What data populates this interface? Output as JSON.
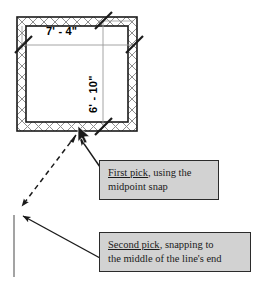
{
  "drawing": {
    "type": "cad-floor-plan-annotation",
    "title": "Midpoint snap line draw illustration",
    "background_color": "#ffffff",
    "line_color": "#1a1a1a",
    "wall_hatch_color": "#8a8a8a",
    "dim_line_color": "#9a9a9a",
    "existing_line_color": "#8c8c8c",
    "callout_fill": "#d2d2d2",
    "callout_border": "#2b2b2b"
  },
  "plan": {
    "name": "rectangular-room",
    "outer": {
      "x": 17,
      "y": 17,
      "w": 120,
      "h": 114
    },
    "inner": {
      "x": 27,
      "y": 26,
      "w": 101,
      "h": 95
    },
    "wall_thickness": 9
  },
  "dimensions": [
    {
      "id": "horizontal",
      "value": "7' - 4\"",
      "orientation": "horizontal",
      "text_x": 46,
      "text_y": 32
    },
    {
      "id": "vertical",
      "value": "6' - 10\"",
      "orientation": "vertical",
      "text_x": 87,
      "text_y": 113
    }
  ],
  "new_line": {
    "name": "dashed-rubber-band-line",
    "style": "dashed",
    "from_label": "midpoint of bottom wall",
    "to_label": "middle of existing line's end",
    "x1": 77,
    "y1": 136,
    "x2": 20,
    "y2": 208
  },
  "existing_line": {
    "name": "existing-vertical-line",
    "x1": 14,
    "y1": 215,
    "x2": 14,
    "y2": 277
  },
  "cursor": {
    "name": "mouse-pointer",
    "x": 80,
    "y": 131
  },
  "callouts": [
    {
      "id": "first-pick",
      "lead": "First pick",
      "rest": ", using the",
      "line2": "midpoint snap",
      "box": {
        "x": 99,
        "y": 160,
        "w": 120,
        "h": 40
      },
      "leader": {
        "x1": 99,
        "y1": 166,
        "x2": 83,
        "y2": 139
      }
    },
    {
      "id": "second-pick",
      "lead": "Second pick",
      "rest": ", snapping to",
      "line2": "the middle of the line's end",
      "box": {
        "x": 99,
        "y": 232,
        "w": 152,
        "h": 40
      },
      "leader": {
        "x1": 99,
        "y1": 258,
        "x2": 22,
        "y2": 216
      }
    }
  ]
}
